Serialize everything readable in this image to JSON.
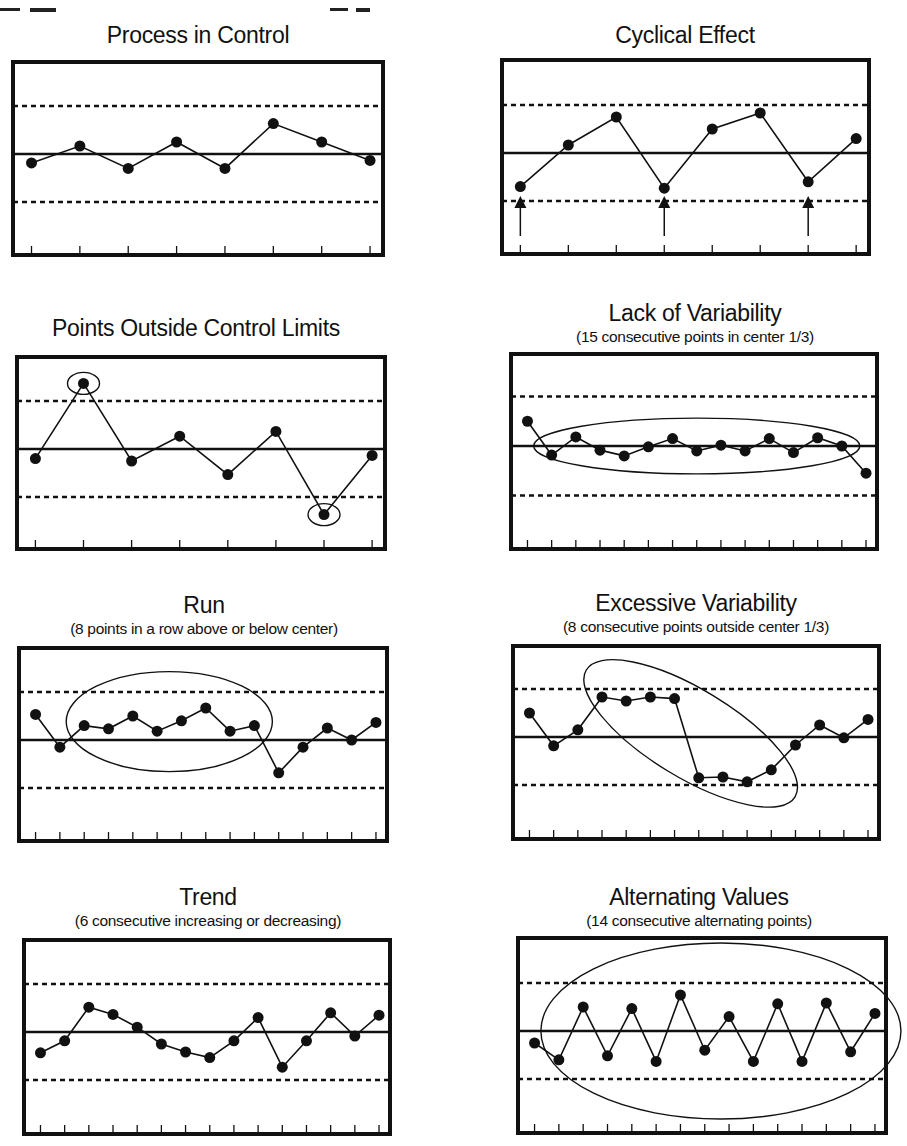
{
  "chart_data": [
    {
      "id": "process-in-control",
      "type": "line",
      "title": "Process in Control",
      "subtitle": "",
      "xlabel": "",
      "ylabel": "",
      "ylim": [
        -5,
        5
      ],
      "limits": {
        "ucl": 3,
        "center": 0,
        "lcl": -3
      },
      "grid": false,
      "x": [
        1,
        2,
        3,
        4,
        5,
        6,
        7,
        8
      ],
      "values": [
        -0.56,
        0.5,
        -0.9,
        0.75,
        -0.9,
        1.9,
        0.75,
        -0.4
      ],
      "annotations": []
    },
    {
      "id": "cyclical-effect",
      "type": "line",
      "title": "Cyclical Effect",
      "subtitle": "",
      "xlabel": "",
      "ylabel": "",
      "ylim": [
        -5,
        5
      ],
      "limits": {
        "ucl": 3,
        "center": 0,
        "lcl": -3
      },
      "grid": false,
      "x": [
        1,
        2,
        3,
        4,
        5,
        6,
        7,
        8
      ],
      "values": [
        -2.1,
        0.5,
        2.25,
        -2.2,
        1.5,
        2.5,
        -1.8,
        0.9
      ],
      "annotations": [
        {
          "type": "arrow-up",
          "at_index": 0
        },
        {
          "type": "arrow-up",
          "at_index": 3
        },
        {
          "type": "arrow-up",
          "at_index": 6
        }
      ]
    },
    {
      "id": "points-outside-limits",
      "type": "line",
      "title": "Points Outside Control Limits",
      "subtitle": "",
      "xlabel": "",
      "ylabel": "",
      "ylim": [
        -5,
        5
      ],
      "limits": {
        "ucl": 3,
        "center": 0,
        "lcl": -3
      },
      "grid": false,
      "x": [
        1,
        2,
        3,
        4,
        5,
        6,
        7,
        8
      ],
      "values": [
        -0.6,
        4.1,
        -0.75,
        0.8,
        -1.6,
        1.1,
        -4.1,
        -0.4
      ],
      "annotations": [
        {
          "type": "circle",
          "at_index": 1
        },
        {
          "type": "circle",
          "at_index": 6
        }
      ]
    },
    {
      "id": "lack-of-variability",
      "type": "line",
      "title": "Lack of Variability",
      "subtitle": "(15 consecutive points in center 1/3)",
      "xlabel": "",
      "ylabel": "",
      "ylim": [
        -5,
        5
      ],
      "limits": {
        "ucl": 3,
        "center": 0,
        "lcl": -3
      },
      "grid": false,
      "x": [
        1,
        2,
        3,
        4,
        5,
        6,
        7,
        8,
        9,
        10,
        11,
        12,
        13,
        14,
        15
      ],
      "values": [
        1.5,
        -0.55,
        0.55,
        -0.25,
        -0.6,
        -0.05,
        0.45,
        -0.3,
        0.05,
        -0.3,
        0.45,
        -0.4,
        0.5,
        0.0,
        -1.65
      ],
      "annotations": [
        {
          "type": "ellipse",
          "from_index": 1,
          "to_index": 13
        }
      ]
    },
    {
      "id": "run",
      "type": "line",
      "title": "Run",
      "subtitle": "(8 points in a row above or below center)",
      "xlabel": "",
      "ylabel": "",
      "ylim": [
        -5,
        5
      ],
      "limits": {
        "ucl": 3,
        "center": 0,
        "lcl": -3
      },
      "grid": false,
      "x": [
        1,
        2,
        3,
        4,
        5,
        6,
        7,
        8,
        9,
        10,
        11,
        12,
        13,
        14,
        15
      ],
      "values": [
        1.6,
        -0.45,
        0.9,
        0.7,
        1.5,
        0.55,
        1.2,
        2.0,
        0.55,
        0.9,
        -2.05,
        -0.45,
        0.75,
        0.0,
        1.1
      ],
      "annotations": [
        {
          "type": "ellipse",
          "from_index": 2,
          "to_index": 9
        }
      ]
    },
    {
      "id": "excessive-variability",
      "type": "line",
      "title": "Excessive Variability",
      "subtitle": "(8 consecutive points outside center 1/3)",
      "xlabel": "",
      "ylabel": "",
      "ylim": [
        -5,
        5
      ],
      "limits": {
        "ucl": 3,
        "center": 0,
        "lcl": -3
      },
      "grid": false,
      "x": [
        1,
        2,
        3,
        4,
        5,
        6,
        7,
        8,
        9,
        10,
        11,
        12,
        13,
        14,
        15
      ],
      "values": [
        1.5,
        -0.55,
        0.45,
        2.5,
        2.25,
        2.5,
        2.4,
        -2.55,
        -2.5,
        -2.8,
        -2.05,
        -0.5,
        0.75,
        -0.05,
        1.1
      ],
      "annotations": [
        {
          "type": "tilted-ellipse",
          "from_index": 3,
          "to_index": 10
        }
      ]
    },
    {
      "id": "trend",
      "type": "line",
      "title": "Trend",
      "subtitle": "(6 consecutive increasing or decreasing)",
      "xlabel": "",
      "ylabel": "",
      "ylim": [
        -5,
        5
      ],
      "limits": {
        "ucl": 3,
        "center": 0,
        "lcl": -3
      },
      "grid": false,
      "x": [
        1,
        2,
        3,
        4,
        5,
        6,
        7,
        8,
        9,
        10,
        11,
        12,
        13,
        14,
        15
      ],
      "values": [
        -1.3,
        -0.55,
        1.55,
        1.1,
        0.3,
        -0.75,
        -1.25,
        -1.6,
        -0.55,
        0.9,
        -2.2,
        -0.55,
        1.2,
        -0.25,
        1.05
      ],
      "annotations": []
    },
    {
      "id": "alternating-values",
      "type": "line",
      "title": "Alternating Values",
      "subtitle": "(14 consecutive alternating points)",
      "xlabel": "",
      "ylabel": "",
      "ylim": [
        -5,
        5
      ],
      "limits": {
        "ucl": 3,
        "center": 0,
        "lcl": -3
      },
      "grid": false,
      "x": [
        1,
        2,
        3,
        4,
        5,
        6,
        7,
        8,
        9,
        10,
        11,
        12,
        13,
        14,
        15
      ],
      "values": [
        -0.75,
        -1.8,
        1.5,
        -1.55,
        1.4,
        -1.9,
        2.25,
        -1.2,
        0.9,
        -1.9,
        1.7,
        -1.9,
        1.75,
        -1.3,
        1.1
      ],
      "annotations": [
        {
          "type": "ellipse",
          "from_index": 1,
          "to_index": 14
        }
      ]
    }
  ],
  "colors": {
    "ink": "#111111",
    "background": "#ffffff"
  }
}
